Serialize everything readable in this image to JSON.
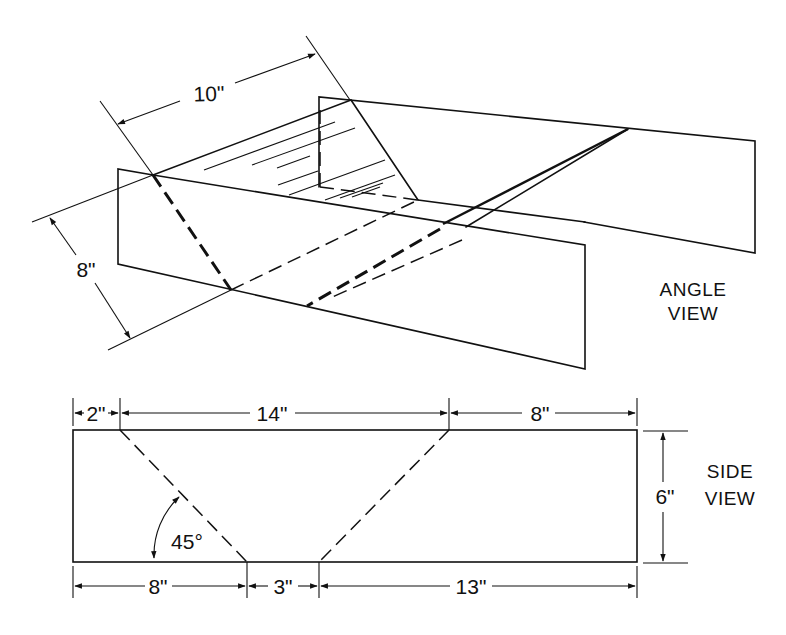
{
  "angle_view": {
    "title_line1": "ANGLE",
    "title_line2": "VIEW",
    "dim_width": "10\"",
    "dim_height": "8\""
  },
  "side_view": {
    "title_line1": "SIDE",
    "title_line2": "VIEW",
    "top_dims": [
      "2\"",
      "14\"",
      "8\""
    ],
    "bottom_dims": [
      "8\"",
      "3\"",
      "13\""
    ],
    "height_dim": "6\"",
    "angle": "45°"
  },
  "colors": {
    "ink": "#111111",
    "background": "#ffffff"
  }
}
